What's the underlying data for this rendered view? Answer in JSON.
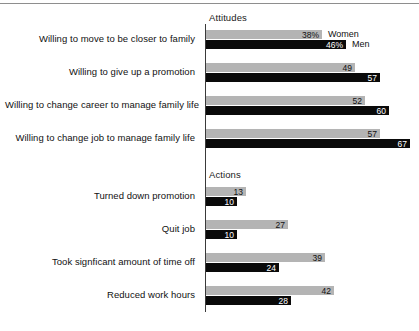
{
  "chart_data": {
    "type": "bar",
    "orientation": "horizontal",
    "title": "",
    "xlabel": "",
    "ylabel": "",
    "xlim": [
      0,
      70
    ],
    "grid": false,
    "legend_position": "inline-right-of-first-group",
    "series": [
      {
        "name": "Women",
        "color": "#b4b4b4"
      },
      {
        "name": "Men",
        "color": "#0a0a0a"
      }
    ],
    "sections": [
      {
        "name": "Attitudes",
        "categories": [
          "Willing to move to be closer to family",
          "Willing to give up a promotion",
          "Willing to change career to manage family life",
          "Willing to change job to manage family life"
        ],
        "values": {
          "Women": [
            38,
            49,
            52,
            57
          ],
          "Men": [
            46,
            57,
            60,
            67
          ]
        },
        "labels": {
          "Women": [
            "38%",
            "49",
            "52",
            "57"
          ],
          "Men": [
            "46%",
            "57",
            "60",
            "67"
          ]
        }
      },
      {
        "name": "Actions",
        "categories": [
          "Turned down promotion",
          "Quit job",
          "Took signficant amount of time off",
          "Reduced work hours"
        ],
        "values": {
          "Women": [
            13,
            27,
            39,
            42
          ],
          "Men": [
            10,
            10,
            24,
            28
          ]
        },
        "labels": {
          "Women": [
            "13",
            "27",
            "39",
            "42"
          ],
          "Men": [
            "10",
            "10",
            "24",
            "28"
          ]
        }
      }
    ]
  },
  "sections": {
    "attitudes": {
      "title": "Attitudes",
      "rows": [
        {
          "label": "Willing to move to be closer to family",
          "women": "38%",
          "men": "46%",
          "women_w": 116,
          "men_w": 140
        },
        {
          "label": "Willing to give up a promotion",
          "women": "49",
          "men": "57",
          "women_w": 149,
          "men_w": 174
        },
        {
          "label": "Willing to change career to manage family life",
          "women": "52",
          "men": "60",
          "women_w": 159,
          "men_w": 183
        },
        {
          "label": "Willing to change job to manage family life",
          "women": "57",
          "men": "67",
          "women_w": 174,
          "men_w": 204
        }
      ]
    },
    "actions": {
      "title": "Actions",
      "rows": [
        {
          "label": "Turned down promotion",
          "women": "13",
          "men": "10",
          "women_w": 40,
          "men_w": 31
        },
        {
          "label": "Quit job",
          "women": "27",
          "men": "10",
          "women_w": 82,
          "men_w": 31
        },
        {
          "label": "Took signficant amount of time off",
          "women": "39",
          "men": "24",
          "women_w": 119,
          "men_w": 73
        },
        {
          "label": "Reduced work hours",
          "women": "42",
          "men": "28",
          "women_w": 128,
          "men_w": 85
        }
      ]
    }
  },
  "legend": {
    "women": "Women",
    "men": "Men"
  },
  "colors": {
    "women_bar": "#b4b4b4",
    "men_bar": "#0a0a0a",
    "axis": "#3a3a3a",
    "text": "#111111"
  }
}
